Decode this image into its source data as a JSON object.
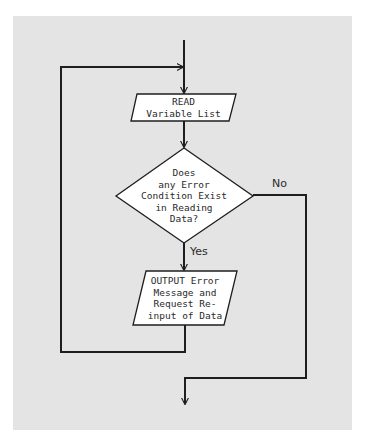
{
  "diagram": {
    "type": "flowchart",
    "background_color": "#e4e4e4",
    "line_color": "#1e1e1e",
    "shape_fill": "#ffffff",
    "nodes": [
      {
        "id": "read",
        "shape": "parallelogram",
        "lines": [
          "READ",
          "Variable List"
        ]
      },
      {
        "id": "decision",
        "shape": "diamond",
        "lines": [
          "Does",
          "any Error",
          "Condition Exist",
          "in Reading",
          "Data?"
        ]
      },
      {
        "id": "output",
        "shape": "parallelogram",
        "lines": [
          "OUTPUT Error",
          "Message and",
          "Request Re-",
          "input of Data"
        ]
      }
    ],
    "edges": [
      {
        "from": "entry",
        "to": "read"
      },
      {
        "from": "read",
        "to": "decision"
      },
      {
        "from": "decision",
        "to": "output",
        "label": "Yes"
      },
      {
        "from": "decision",
        "to": "exit",
        "label": "No"
      },
      {
        "from": "output",
        "to": "read",
        "label": ""
      }
    ],
    "edge_labels": {
      "yes": "Yes",
      "no": "No"
    }
  }
}
